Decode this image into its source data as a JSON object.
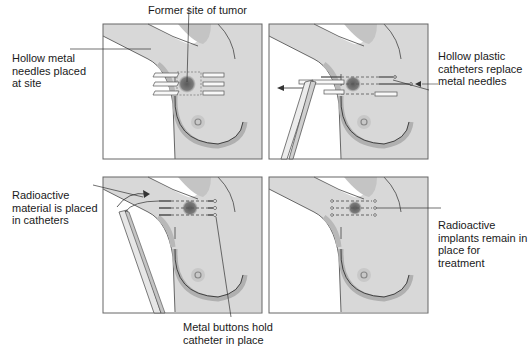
{
  "figure": {
    "panels": [
      {
        "id": "step-1",
        "label": "Hollow metal\nneedles placed\nat site",
        "top_label": "Former site of tumor"
      },
      {
        "id": "step-2",
        "label": "Hollow plastic\ncatheters replace\nmetal needles"
      },
      {
        "id": "step-3",
        "label": "Radioactive\nmaterial is placed\nin catheters",
        "bottom_label": "Metal buttons hold\ncatheter in place"
      },
      {
        "id": "step-4",
        "label": "Radioactive\nimplants remain in\nplace for treatment"
      }
    ],
    "colors": {
      "skin": "#d9d9d9",
      "skin_shadow": "#bdbdbd",
      "background": "#ffffff",
      "outline": "#555555",
      "tumor": "#6e6e6e",
      "catheter": "#444444"
    }
  }
}
